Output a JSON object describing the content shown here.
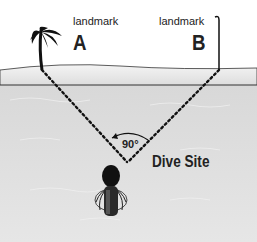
{
  "diagram": {
    "landmark_a": {
      "caption": "landmark",
      "letter": "A"
    },
    "landmark_b": {
      "caption": "landmark",
      "letter": "B"
    },
    "angle": "90°",
    "site_label": "Dive Site",
    "colors": {
      "sky": "#ffffff",
      "beach": "#ececec",
      "water": "#d9d9d9",
      "line": "#222222"
    }
  }
}
